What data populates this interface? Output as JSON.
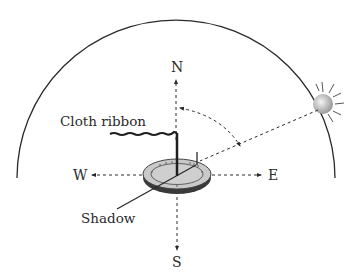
{
  "diagram": {
    "labels": {
      "north": "N",
      "south": "S",
      "east": "E",
      "west": "W",
      "ribbon": "Cloth ribbon",
      "shadow": "Shadow"
    },
    "colors": {
      "line": "#2a2a2a",
      "dial_fill": "#c8c8c8",
      "dial_edge": "#555555",
      "sun_light": "#f0f0f0",
      "sun_dark": "#a8a8a8"
    },
    "icons": {
      "sun": "sun-icon",
      "sundial": "sundial-icon",
      "ribbon": "wavy-ribbon-icon"
    }
  }
}
